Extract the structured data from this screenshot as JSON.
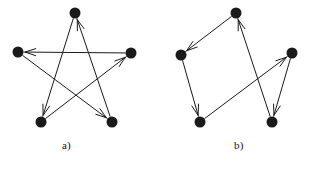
{
  "figure": {
    "title": "",
    "width": 313,
    "height": 175,
    "background": "#ffffff",
    "ink_color": "#1a1a1a",
    "node_radius": 5.5,
    "edge_width": 1.0,
    "arrow_style": "open-v-head"
  },
  "panels": [
    {
      "id": "a",
      "label": "a)",
      "label_position": {
        "x": 62,
        "y": 139
      },
      "caption": "directed pentagram: five vertices joined by a single 5-cycle of chords",
      "nodes": [
        {
          "id": "top",
          "name": "vertex-top",
          "x": 75,
          "y": 13
        },
        {
          "id": "left",
          "name": "vertex-left",
          "x": 18,
          "y": 52
        },
        {
          "id": "right",
          "name": "vertex-right",
          "x": 131,
          "y": 53
        },
        {
          "id": "bottom-left",
          "name": "vertex-bottom-left",
          "x": 41,
          "y": 122
        },
        {
          "id": "bottom-right",
          "name": "vertex-bottom-right",
          "x": 112,
          "y": 122
        }
      ],
      "edges": [
        {
          "from": "top",
          "to": "bottom-left",
          "directed": true
        },
        {
          "from": "bottom-left",
          "to": "right",
          "directed": true
        },
        {
          "from": "right",
          "to": "left",
          "directed": true
        },
        {
          "from": "left",
          "to": "bottom-right",
          "directed": true
        },
        {
          "from": "bottom-right",
          "to": "top",
          "directed": true
        }
      ]
    },
    {
      "id": "b",
      "label": "b)",
      "label_position": {
        "x": 234,
        "y": 139
      },
      "caption": "directed five-vertex graph: quadrilateral path with a crossing chord",
      "nodes": [
        {
          "id": "top",
          "name": "vertex-top",
          "x": 236,
          "y": 13
        },
        {
          "id": "left",
          "name": "vertex-left",
          "x": 181,
          "y": 55
        },
        {
          "id": "right",
          "name": "vertex-right",
          "x": 292,
          "y": 53
        },
        {
          "id": "bottom-left",
          "name": "vertex-bottom-left",
          "x": 200,
          "y": 122
        },
        {
          "id": "bottom-right",
          "name": "vertex-bottom-right",
          "x": 272,
          "y": 122
        }
      ],
      "edges": [
        {
          "from": "top",
          "to": "left",
          "directed": true
        },
        {
          "from": "left",
          "to": "bottom-left",
          "directed": true
        },
        {
          "from": "bottom-left",
          "to": "right",
          "directed": true
        },
        {
          "from": "right",
          "to": "bottom-right",
          "directed": true
        },
        {
          "from": "bottom-right",
          "to": "top",
          "directed": true
        }
      ]
    }
  ]
}
